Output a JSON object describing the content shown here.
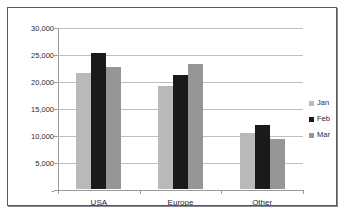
{
  "chart_data": {
    "type": "bar",
    "title": "",
    "subtitle": "",
    "xlabel": "",
    "ylabel": "",
    "categories": [
      "USA",
      "Europe",
      "Other"
    ],
    "series": [
      {
        "name": "Jan",
        "color": "#b9b9b9",
        "values": [
          21500,
          19000,
          10400
        ]
      },
      {
        "name": "Feb",
        "color": "#1a1a1a",
        "values": [
          25200,
          21100,
          11900
        ]
      },
      {
        "name": "Mar",
        "color": "#969696",
        "values": [
          22600,
          23200,
          9200
        ]
      }
    ],
    "ylim": [
      0,
      30000
    ],
    "yticks": [
      0,
      5000,
      10000,
      15000,
      20000,
      25000,
      30000
    ],
    "ytick_labels": [
      "-",
      "5,000",
      "10,000",
      "15,000",
      "20,000",
      "25,000",
      "30,000"
    ],
    "grid": true,
    "grid_axis": "y",
    "legend_position": "right",
    "annotations": []
  },
  "legend": {
    "items": [
      {
        "label": "Jan",
        "color": "#b9b9b9"
      },
      {
        "label": "Feb",
        "color": "#1a1a1a"
      },
      {
        "label": "Mar",
        "color": "#969696"
      }
    ]
  },
  "colors": {
    "frame_border": "#585860",
    "gridline": "#bfbfbf",
    "axis": "#9a9a9a",
    "text": "#2b2b2b",
    "background": "#ffffff"
  }
}
